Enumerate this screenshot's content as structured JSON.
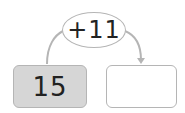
{
  "diagram": {
    "operation": "+11",
    "start_value": "15",
    "result_value": "",
    "colors": {
      "start_box_fill": "#d6d6d6",
      "result_box_fill": "#ffffff",
      "stroke": "#b5b5b5"
    }
  }
}
